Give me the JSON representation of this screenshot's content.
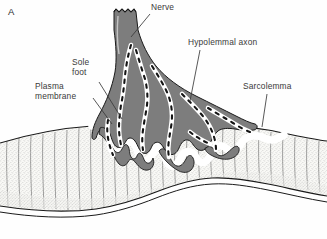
{
  "figure": {
    "panel_letter": "A",
    "width": 327,
    "height": 239,
    "background_color": "#fefefe",
    "style": "line-drawing"
  },
  "colors": {
    "nerve_fill": "#7d7d7d",
    "nerve_outline": "#1a1a1a",
    "axon_channel": "#ffffff",
    "axon_dash": "#141414",
    "plasma_membrane": "#ffffff",
    "muscle_fill": "#f7f7f4",
    "muscle_stipple": "#9a9a9a",
    "striation_line": "#4a4a4a",
    "sarcolemma_line": "#1a1a1a",
    "label_text": "#3a3a3a",
    "leader_line": "#3a3a3a"
  },
  "labels": [
    {
      "id": "nerve",
      "text": "Nerve",
      "lines": [
        "Nerve"
      ],
      "x": 151,
      "y": 3,
      "align": "left",
      "leader": {
        "from_x": 150,
        "from_y": 14,
        "to_x": 131,
        "to_y": 37
      }
    },
    {
      "id": "hypolemmal-axon",
      "text": "Hypolemmal axon",
      "lines": [
        "Hypolemmal axon"
      ],
      "x": 188,
      "y": 38,
      "align": "left",
      "leader": {
        "from_x": 200,
        "from_y": 50,
        "to_x": 190,
        "to_y": 101
      }
    },
    {
      "id": "sole-foot",
      "text": "Sole foot",
      "lines": [
        "Sole",
        "foot"
      ],
      "x": 72,
      "y": 58,
      "align": "left",
      "leader": {
        "from_x": 99,
        "from_y": 82,
        "to_x": 122,
        "to_y": 119
      }
    },
    {
      "id": "plasma-membrane",
      "text": "Plasma membrane",
      "lines": [
        "Plasma",
        "membrane"
      ],
      "x": 35,
      "y": 82,
      "align": "left",
      "leader": {
        "from_x": 93,
        "from_y": 98,
        "to_x": 112,
        "to_y": 124
      }
    },
    {
      "id": "sarcolemma",
      "text": "Sarcolemma",
      "lines": [
        "Sarcolemma"
      ],
      "x": 243,
      "y": 82,
      "align": "left",
      "leader": {
        "from_x": 267,
        "from_y": 94,
        "to_x": 262,
        "to_y": 127
      }
    }
  ],
  "structures": [
    {
      "id": "nerve-trunk",
      "name": "nerve trunk with cut jagged end",
      "interactable": false
    },
    {
      "id": "nerve-terminal",
      "name": "branching nerve terminal arborization",
      "interactable": false
    },
    {
      "id": "axon-channels",
      "name": "hypolemmal axon channels with vesicle dashes",
      "interactable": false
    },
    {
      "id": "plasma-membrane-band",
      "name": "white plasma membrane band following synaptic gutter",
      "interactable": false
    },
    {
      "id": "muscle-fiber",
      "name": "striated muscle fiber",
      "interactable": false
    },
    {
      "id": "sarcolemma-line",
      "name": "sarcolemma boundary line",
      "interactable": false
    }
  ]
}
